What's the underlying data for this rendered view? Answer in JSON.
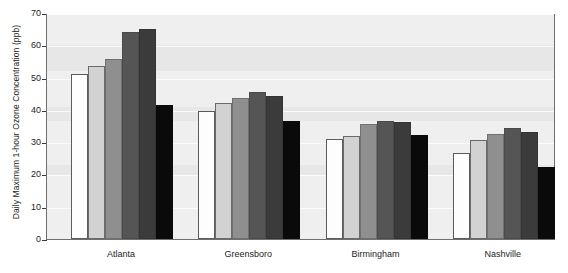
{
  "chart_data": {
    "type": "bar",
    "title": "",
    "xlabel": "",
    "ylabel": "Daily Maximum 1-hour Ozone Concentration (ppb)",
    "ylim": [
      0,
      70
    ],
    "ytick_labels": [
      "70",
      "60",
      "50",
      "40",
      "30",
      "20",
      "10",
      "0"
    ],
    "yticks": [
      70,
      60,
      50,
      40,
      30,
      20,
      10,
      0
    ],
    "grid": true,
    "legend": "none",
    "categories": [
      "Atlanta",
      "Greensboro",
      "Birmingham",
      "Nashville"
    ],
    "series": [
      {
        "name": "Bar 1",
        "color": "#fdfdfd",
        "values": [
          51,
          39.8,
          31,
          26.6
        ]
      },
      {
        "name": "Bar 2",
        "color": "#d2d2d2",
        "values": [
          53.6,
          42,
          31.8,
          30.7
        ]
      },
      {
        "name": "Bar 3",
        "color": "#8f8f8f",
        "values": [
          55.8,
          43.7,
          35.7,
          32.6
        ]
      },
      {
        "name": "Bar 4",
        "color": "#555555",
        "values": [
          64,
          45.5,
          36.4,
          34.4
        ]
      },
      {
        "name": "Bar 5",
        "color": "#3b3b3b",
        "values": [
          65.1,
          44.4,
          36.2,
          33.3
        ]
      },
      {
        "name": "Bar 6",
        "color": "#0a0a0a",
        "values": [
          41.6,
          36.5,
          32.3,
          22.3
        ]
      }
    ]
  },
  "axis": {
    "y_title": "Daily Maximum 1-hour Ozone Concentration (ppb)"
  }
}
